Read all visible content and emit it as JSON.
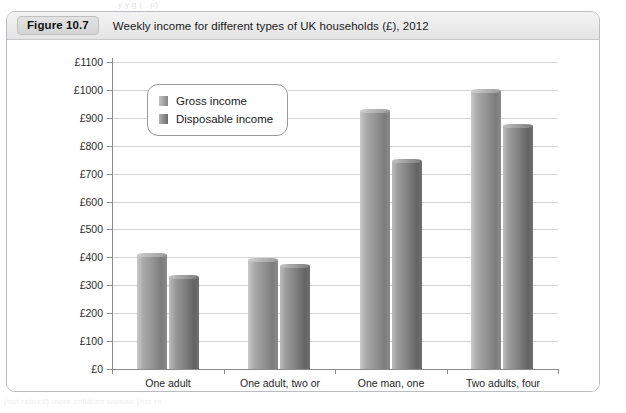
{
  "bleed": {
    "top_text": "y  y            g (                    , p)",
    "bottom_text": "(not retired)      more children      woman (not re"
  },
  "figure": {
    "badge": "Figure 10.7",
    "title": "Weekly income for different types of UK households (£), 2012"
  },
  "chart_data": {
    "type": "bar",
    "title": "Weekly income for different types of UK households (£), 2012",
    "xlabel": "",
    "ylabel": "",
    "ylim": [
      0,
      1100
    ],
    "grid": true,
    "legend_position": "top-left-inside",
    "currency_prefix": "£",
    "tick_labels": [
      "£0",
      "£100",
      "£200",
      "£300",
      "£400",
      "£500",
      "£600",
      "£700",
      "£800",
      "£900",
      "£1000",
      "£1100"
    ],
    "tick_values": [
      0,
      100,
      200,
      300,
      400,
      500,
      600,
      700,
      800,
      900,
      1000,
      1100
    ],
    "categories": [
      "One adult\n(not retired)",
      "One adult, two or\nmore children",
      "One man, one\nwoman (not retired)",
      "Two adults, four\nor more children"
    ],
    "series": [
      {
        "name": "Gross income",
        "color": "#8f8f8f",
        "values": [
          410,
          390,
          925,
          995
        ]
      },
      {
        "name": "Disposable income",
        "color": "#707070",
        "values": [
          330,
          370,
          745,
          870
        ]
      }
    ]
  }
}
